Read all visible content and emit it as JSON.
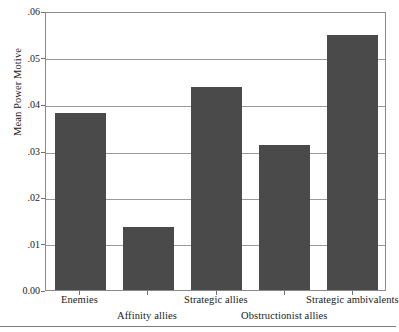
{
  "chart_data": {
    "type": "bar",
    "title": "",
    "subtitle": "",
    "xlabel": "",
    "ylabel": "Mean Power Motive",
    "categories": [
      "Enemies",
      "Affinity allies",
      "Strategic allies",
      "Obstructionist allies",
      "Strategic ambivalents"
    ],
    "values": [
      0.038,
      0.0135,
      0.0436,
      0.0312,
      0.0548
    ],
    "ylim": [
      0.0,
      0.06
    ],
    "ytick_values": [
      0.0,
      0.01,
      0.02,
      0.03,
      0.04,
      0.05,
      0.06
    ],
    "ytick_labels": [
      "0.00",
      ".01",
      ".02",
      ".03",
      ".04",
      ".05",
      ".06"
    ],
    "grid": true,
    "grid_axis": "y",
    "legend": false,
    "legend_position": "none",
    "bar_color": "#4a4a4a",
    "gridline_color": "#9a9a9a",
    "frame_color": "#8a8a8a",
    "background_color": "#ffffff",
    "xtick_label_stagger": [
      "top",
      "bottom",
      "top",
      "bottom",
      "top"
    ]
  },
  "figure": {
    "bottom_rule_color": "#7c7c7c"
  }
}
